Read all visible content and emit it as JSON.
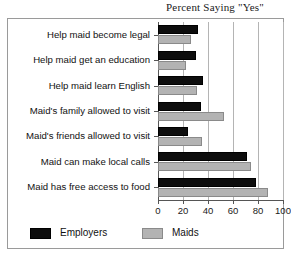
{
  "chart_data": {
    "type": "bar",
    "orientation": "horizontal",
    "title": "Percent Saying \"Yes\"",
    "xlabel": "",
    "ylabel": "",
    "xlim": [
      0,
      100
    ],
    "xticks": [
      0,
      20,
      40,
      60,
      80,
      100
    ],
    "grid": true,
    "legend_position": "bottom",
    "categories": [
      "Help maid become legal",
      "Help maid get an education",
      "Help maid learn English",
      "Maid's family allowed to visit",
      "Maid's friends allowed to visit",
      "Maid can make local calls",
      "Maid has free access to food"
    ],
    "series": [
      {
        "name": "Employers",
        "color": "#0d0d0d",
        "values": [
          32,
          30,
          36,
          34,
          24,
          71,
          78
        ]
      },
      {
        "name": "Maids",
        "color": "#b3b3b3",
        "values": [
          26,
          22,
          31,
          53,
          35,
          74,
          88
        ]
      }
    ]
  },
  "legend": {
    "items": [
      {
        "label": "Employers",
        "swatch": "employers-swatch"
      },
      {
        "label": "Maids",
        "swatch": "maids-swatch"
      }
    ]
  },
  "ticklabels": [
    "0",
    "20",
    "40",
    "60",
    "80",
    "100"
  ]
}
